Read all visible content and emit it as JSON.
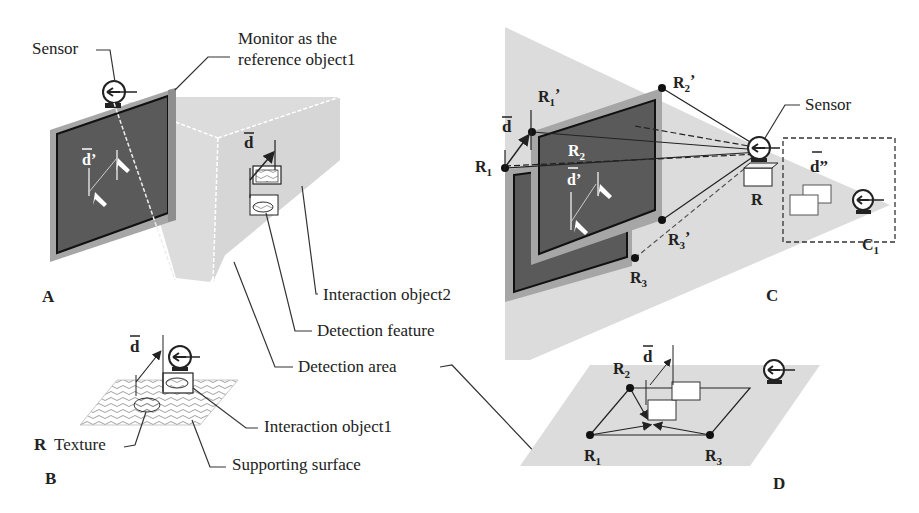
{
  "figure": {
    "panels": [
      {
        "id": "A",
        "label": "A"
      },
      {
        "id": "B",
        "label": "B"
      },
      {
        "id": "C",
        "label": "C"
      },
      {
        "id": "D",
        "label": "D"
      }
    ],
    "callouts": {
      "sensor_a": "Sensor",
      "monitor_line1": "Monitor as the",
      "monitor_line2": "reference object1",
      "interaction_object2": "Interaction object2",
      "detection_feature": "Detection feature",
      "detection_area": "Detection area",
      "interaction_object1": "Interaction object1",
      "supporting_surface": "Supporting surface",
      "texture": "Texture",
      "texture_prefix": "R",
      "sensor_c": "Sensor"
    },
    "vectors": {
      "d": "d",
      "d_prime": "d’",
      "d_double_prime": "d”"
    },
    "points": {
      "R": "R",
      "R1": {
        "base": "R",
        "sub": "1"
      },
      "R1_prime": {
        "base": "R",
        "sub": "1",
        "prime": "’"
      },
      "R2": {
        "base": "R",
        "sub": "2"
      },
      "R2_prime": {
        "base": "R",
        "sub": "2",
        "prime": "’"
      },
      "R3": {
        "base": "R",
        "sub": "3"
      },
      "R3_prime": {
        "base": "R",
        "sub": "3",
        "prime": "’"
      },
      "C1": {
        "base": "C",
        "sub": "1"
      }
    },
    "colors": {
      "screen": "#5a5a5a",
      "bezel": "#a6a6a6",
      "area": "#dedede",
      "line": "#222222"
    }
  }
}
